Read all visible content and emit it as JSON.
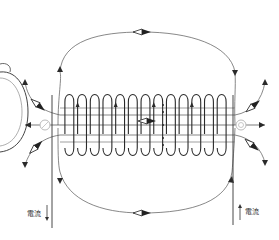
{
  "figure": {
    "coil_turns": 13,
    "colors": {
      "ink": "#2a2a2a",
      "field_line": "#555555",
      "needle_dark": "#222222",
      "needle_light": "#ffffff",
      "end_compass": "#bbbbbb"
    }
  },
  "labels": {
    "current_left": "電流",
    "current_right": "電流"
  },
  "current_arrows": [
    {
      "name": "current-left",
      "direction": "down"
    },
    {
      "name": "current-right",
      "direction": "up"
    }
  ],
  "compass_needles": [
    {
      "name": "compass-top",
      "orientation": "horizontal"
    },
    {
      "name": "compass-bottom",
      "orientation": "horizontal"
    },
    {
      "name": "compass-inside",
      "orientation": "horizontal"
    },
    {
      "name": "compass-upper-left",
      "orientation": "diagonal"
    },
    {
      "name": "compass-lower-left",
      "orientation": "diagonal"
    },
    {
      "name": "compass-upper-right",
      "orientation": "diagonal"
    },
    {
      "name": "compass-lower-right",
      "orientation": "diagonal"
    }
  ],
  "end_compasses": [
    {
      "name": "end-compass-left"
    },
    {
      "name": "end-compass-right"
    }
  ]
}
